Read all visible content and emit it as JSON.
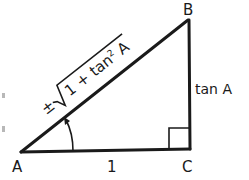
{
  "diagram": {
    "type": "right-triangle",
    "vertices": {
      "A": {
        "label": "A"
      },
      "B": {
        "label": "B"
      },
      "C": {
        "label": "C"
      }
    },
    "sides": {
      "base": {
        "label": "1"
      },
      "opposite": {
        "label": "tan A"
      },
      "hypotenuse": {
        "sign": "±",
        "radicand_prefix": "1 + tan",
        "exponent": "2",
        "radicand_suffix": " A"
      }
    },
    "angle_marker": "A",
    "right_angle_at": "C"
  },
  "colors": {
    "ink": "#1a1a1a",
    "background": "#ffffff"
  }
}
